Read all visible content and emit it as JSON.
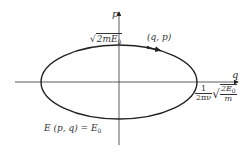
{
  "diagram": {
    "type": "phase-space ellipse",
    "axes": {
      "horizontal": {
        "label": "q"
      },
      "vertical": {
        "label": "p"
      }
    },
    "labels": {
      "p_intercept": {
        "radicand": "2mE",
        "subscript": "0"
      },
      "point": "(q, p)",
      "q_intercept": {
        "coef_num": "1",
        "coef_den": "2πν",
        "rad_num_main": "2E",
        "rad_num_sub": "0",
        "rad_den": "m"
      },
      "energy_prefix": "E (p, q) = E",
      "energy_sub": "0"
    },
    "colors": {
      "stroke": "#222222",
      "text": "#333333",
      "background": "#ffffff"
    }
  }
}
